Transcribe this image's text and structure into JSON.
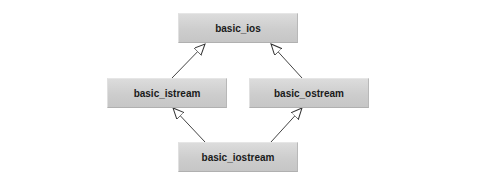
{
  "diagram": {
    "type": "class-inheritance",
    "nodes": [
      {
        "id": "basic_ios",
        "label": "basic_ios"
      },
      {
        "id": "basic_istream",
        "label": "basic_istream"
      },
      {
        "id": "basic_ostream",
        "label": "basic_ostream"
      },
      {
        "id": "basic_iostream",
        "label": "basic_iostream"
      }
    ],
    "edges": [
      {
        "from": "basic_istream",
        "to": "basic_ios",
        "arrow": "hollow-triangle"
      },
      {
        "from": "basic_ostream",
        "to": "basic_ios",
        "arrow": "hollow-triangle"
      },
      {
        "from": "basic_iostream",
        "to": "basic_istream",
        "arrow": "hollow-triangle"
      },
      {
        "from": "basic_iostream",
        "to": "basic_ostream",
        "arrow": "hollow-triangle"
      }
    ]
  }
}
